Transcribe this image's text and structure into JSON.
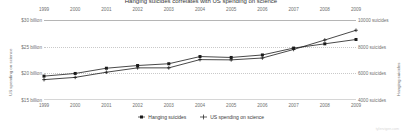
{
  "chart_data": {
    "type": "line",
    "title": "Hanging suicides correlates with US spending on science",
    "x": [
      1999,
      2000,
      2001,
      2002,
      2003,
      2004,
      2005,
      2006,
      2007,
      2008,
      2009
    ],
    "xlabel": "",
    "grid": true,
    "legend_position": "bottom",
    "axes": {
      "left": {
        "label": "US spending on science",
        "ticks": [
          "$30 billion",
          "$25 billion",
          "$20 billion",
          "$15 billion"
        ],
        "tick_values": [
          30,
          25,
          20,
          15
        ],
        "ylim": [
          13.5,
          31.5
        ]
      },
      "right": {
        "label": "Hanging suicides",
        "ticks": [
          "10000 suicides",
          "8000 suicides",
          "6000 suicides",
          "4000 suicides"
        ],
        "tick_values": [
          10000,
          8000,
          6000,
          4000
        ],
        "ylim": [
          3100,
          10900
        ]
      }
    },
    "series": [
      {
        "name": "Hanging suicides",
        "axis": "right",
        "color": "#1a1a1a",
        "marker": "square",
        "values": [
          5427,
          5688,
          6198,
          6462,
          6635,
          7336,
          7248,
          7491,
          8161,
          8578,
          9000
        ]
      },
      {
        "name": "US spending on science",
        "axis": "left",
        "color": "#1a1a1a",
        "marker": "plus",
        "values": [
          18.08,
          18.59,
          19.75,
          20.73,
          20.73,
          22.59,
          22.53,
          22.95,
          24.87,
          27.0,
          29.19
        ]
      }
    ]
  },
  "legend": {
    "items": [
      {
        "label": "Hanging suicides",
        "marker": "square-marker-icon"
      },
      {
        "label": "US spending on science",
        "marker": "plus-marker-icon"
      }
    ]
  },
  "watermark": "tylervigen.com"
}
